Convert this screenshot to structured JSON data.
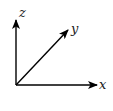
{
  "diagram": {
    "origin": [
      16,
      85
    ],
    "axes": [
      {
        "name": "x",
        "label": "x",
        "tip": [
          97,
          85
        ],
        "label_pos": [
          99,
          89
        ]
      },
      {
        "name": "y",
        "label": "y",
        "tip": [
          68,
          30
        ],
        "label_pos": [
          71,
          33
        ]
      },
      {
        "name": "z",
        "label": "z",
        "tip": [
          16,
          20
        ],
        "label_pos": [
          19,
          17
        ]
      }
    ],
    "colors": {
      "stroke": "#000000",
      "label": "#1a1a1a",
      "background": "#ffffff"
    }
  }
}
